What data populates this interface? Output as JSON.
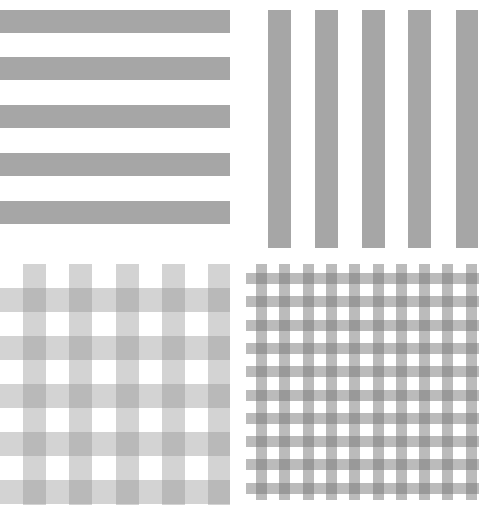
{
  "panels": [
    {
      "id": "horizontal-stripes",
      "pattern": "horizontal stripes",
      "stripe_color": "#a6a6a6",
      "count": 5
    },
    {
      "id": "vertical-stripes",
      "pattern": "vertical stripes",
      "stripe_color": "#a6a6a6",
      "count": 5
    },
    {
      "id": "coarse-gingham",
      "pattern": "gingham (coarse)",
      "light_color": "#cccccc",
      "dark_color": "#a8a8a8"
    },
    {
      "id": "fine-gingham",
      "pattern": "gingham (fine)",
      "light_color": "#bdbdbd",
      "dark_color": "#8a8a8a"
    }
  ]
}
